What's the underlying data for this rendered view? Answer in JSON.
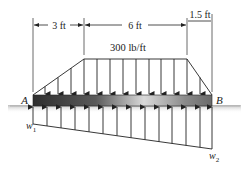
{
  "figure": {
    "type": "beam-loading-diagram",
    "dimensions": [
      {
        "label": "3 ft"
      },
      {
        "label": "6 ft"
      },
      {
        "label": "1.5 ft"
      }
    ],
    "distributed_load": {
      "label": "300 lb/ft"
    },
    "points": {
      "left": "A",
      "right": "B"
    },
    "reactions": {
      "left": {
        "symbol": "w",
        "sub": "1"
      },
      "right": {
        "symbol": "w",
        "sub": "2"
      }
    },
    "colors": {
      "line": "#222222",
      "beam_dark": "#3a3a3a",
      "beam_light": "#d6d6d6",
      "ground": "#cfcfcf"
    }
  }
}
